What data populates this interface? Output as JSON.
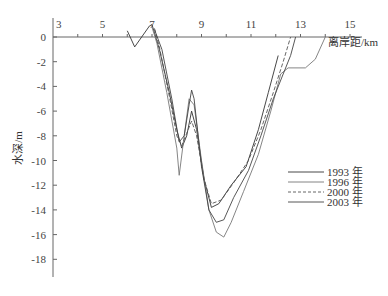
{
  "chart_data": {
    "type": "line",
    "title": "",
    "xlabel": "离岸距/km",
    "ylabel": "水深/m",
    "x_ticks": [
      3,
      5,
      7,
      9,
      11,
      13,
      15
    ],
    "y_ticks": [
      0,
      -2,
      -4,
      -6,
      -8,
      -10,
      -12,
      -14,
      -16,
      -18
    ],
    "xlim": [
      3,
      16
    ],
    "ylim": [
      -19,
      1
    ],
    "grid": false,
    "legend_position": "right-middle",
    "series": [
      {
        "name": "1993 年",
        "style": "solid",
        "color": "#333333",
        "points": [
          [
            6.0,
            0.5
          ],
          [
            6.3,
            -0.8
          ],
          [
            6.9,
            0.9
          ],
          [
            7.0,
            1.0
          ],
          [
            7.3,
            -1.0
          ],
          [
            7.7,
            -4.5
          ],
          [
            8.0,
            -7.5
          ],
          [
            8.2,
            -9.0
          ],
          [
            8.4,
            -8.0
          ],
          [
            8.6,
            -6.0
          ],
          [
            8.8,
            -7.5
          ],
          [
            9.1,
            -11.5
          ],
          [
            9.4,
            -13.8
          ],
          [
            9.7,
            -13.5
          ],
          [
            10.2,
            -12.0
          ],
          [
            10.8,
            -10.5
          ],
          [
            11.3,
            -7.5
          ],
          [
            11.7,
            -4.5
          ],
          [
            12.1,
            -1.5
          ]
        ]
      },
      {
        "name": "1996 年",
        "style": "solid",
        "color": "#777777",
        "points": [
          [
            7.0,
            0.8
          ],
          [
            7.2,
            -0.5
          ],
          [
            7.6,
            -4.5
          ],
          [
            8.0,
            -9.0
          ],
          [
            8.1,
            -11.2
          ],
          [
            8.3,
            -8.0
          ],
          [
            8.5,
            -5.0
          ],
          [
            8.7,
            -5.5
          ],
          [
            9.0,
            -10.0
          ],
          [
            9.3,
            -14.0
          ],
          [
            9.6,
            -15.8
          ],
          [
            9.9,
            -16.2
          ],
          [
            10.2,
            -15.0
          ],
          [
            10.7,
            -12.5
          ],
          [
            11.3,
            -9.5
          ],
          [
            11.8,
            -6.0
          ],
          [
            12.2,
            -3.0
          ],
          [
            12.5,
            -2.5
          ],
          [
            13.2,
            -2.5
          ],
          [
            13.6,
            -1.8
          ],
          [
            14.0,
            0.0
          ]
        ]
      },
      {
        "name": "2000 年",
        "style": "dashed",
        "color": "#555555",
        "points": [
          [
            7.1,
            0.7
          ],
          [
            7.3,
            -0.8
          ],
          [
            7.7,
            -4.8
          ],
          [
            8.0,
            -8.0
          ],
          [
            8.2,
            -8.8
          ],
          [
            8.4,
            -7.8
          ],
          [
            8.6,
            -6.8
          ],
          [
            8.8,
            -8.0
          ],
          [
            9.1,
            -11.5
          ],
          [
            9.4,
            -13.5
          ],
          [
            9.8,
            -13.2
          ],
          [
            10.3,
            -11.8
          ],
          [
            10.9,
            -10.0
          ],
          [
            11.4,
            -7.5
          ],
          [
            11.9,
            -4.5
          ],
          [
            12.3,
            -2.0
          ],
          [
            12.6,
            0.0
          ]
        ]
      },
      {
        "name": "2003 年",
        "style": "solid",
        "color": "#444444",
        "points": [
          [
            7.1,
            0.6
          ],
          [
            7.4,
            -1.0
          ],
          [
            7.8,
            -5.0
          ],
          [
            8.1,
            -8.5
          ],
          [
            8.3,
            -8.0
          ],
          [
            8.5,
            -5.5
          ],
          [
            8.6,
            -4.3
          ],
          [
            8.7,
            -5.0
          ],
          [
            9.0,
            -10.5
          ],
          [
            9.3,
            -14.0
          ],
          [
            9.6,
            -15.0
          ],
          [
            9.9,
            -14.8
          ],
          [
            10.3,
            -13.0
          ],
          [
            10.9,
            -10.8
          ],
          [
            11.4,
            -8.0
          ],
          [
            11.9,
            -5.0
          ],
          [
            12.3,
            -3.0
          ],
          [
            12.6,
            -1.5
          ],
          [
            12.8,
            0.0
          ]
        ]
      }
    ]
  },
  "axes": {
    "x_title": "离岸距/km",
    "y_title": "水深/m"
  },
  "legend": {
    "items": [
      {
        "label": "1993 年",
        "style": "solid"
      },
      {
        "label": "1996 年",
        "style": "solid"
      },
      {
        "label": "2000 年",
        "style": "dashed"
      },
      {
        "label": "2003 年",
        "style": "solid"
      }
    ]
  }
}
